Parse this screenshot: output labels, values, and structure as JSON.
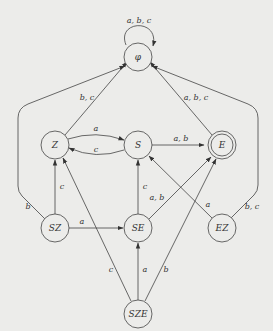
{
  "diagram": {
    "type": "finite-automaton",
    "nodes": [
      {
        "id": "phi",
        "label": "φ",
        "x": 138,
        "y": 52,
        "accepting": false
      },
      {
        "id": "Z",
        "label": "Z",
        "x": 55,
        "y": 145,
        "accepting": false
      },
      {
        "id": "S",
        "label": "S",
        "x": 138,
        "y": 145,
        "accepting": false
      },
      {
        "id": "E",
        "label": "E",
        "x": 222,
        "y": 145,
        "accepting": true
      },
      {
        "id": "SZ",
        "label": "SZ",
        "x": 55,
        "y": 228,
        "accepting": false
      },
      {
        "id": "SE",
        "label": "SE",
        "x": 138,
        "y": 228,
        "accepting": false
      },
      {
        "id": "EZ",
        "label": "EZ",
        "x": 222,
        "y": 228,
        "accepting": false
      },
      {
        "id": "SZE",
        "label": "SZE",
        "x": 138,
        "y": 314,
        "accepting": false
      }
    ],
    "edges": [
      {
        "from": "phi",
        "to": "phi",
        "label": "a, b, c"
      },
      {
        "from": "Z",
        "to": "phi",
        "label": "b, c"
      },
      {
        "from": "E",
        "to": "phi",
        "label": "a, b, c"
      },
      {
        "from": "SZ",
        "to": "phi",
        "label": "b"
      },
      {
        "from": "EZ",
        "to": "phi",
        "label": "b, c"
      },
      {
        "from": "Z",
        "to": "S",
        "label": "a"
      },
      {
        "from": "S",
        "to": "Z",
        "label": "c"
      },
      {
        "from": "S",
        "to": "E",
        "label": "a, b"
      },
      {
        "from": "SZ",
        "to": "Z",
        "label": "c"
      },
      {
        "from": "SZ",
        "to": "SE",
        "label": "a"
      },
      {
        "from": "SE",
        "to": "S",
        "label": "c"
      },
      {
        "from": "SE",
        "to": "E",
        "label": "a, b"
      },
      {
        "from": "EZ",
        "to": "S",
        "label": "a"
      },
      {
        "from": "SZE",
        "to": "Z",
        "label": "c"
      },
      {
        "from": "SZE",
        "to": "SE",
        "label": "a"
      },
      {
        "from": "SZE",
        "to": "E",
        "label": "b"
      }
    ]
  },
  "labels": {
    "phi_loop": "a, b, c",
    "Z_phi": "b, c",
    "E_phi": "a, b, c",
    "SZ_phi": "b",
    "EZ_phi": "b, c",
    "Z_S": "a",
    "S_Z": "c",
    "S_E": "a, b",
    "SZ_Z": "c",
    "SZ_SE": "a",
    "SE_S": "c",
    "SE_E": "a, b",
    "EZ_S": "a",
    "SZE_Z": "c",
    "SZE_SE": "a",
    "SZE_E": "b"
  },
  "node_labels": {
    "phi": "φ",
    "Z": "Z",
    "S": "S",
    "E": "E",
    "SZ": "SZ",
    "SE": "SE",
    "EZ": "EZ",
    "SZE": "SZE"
  },
  "colors": {
    "background": "#ececea",
    "stroke": "#444444"
  }
}
